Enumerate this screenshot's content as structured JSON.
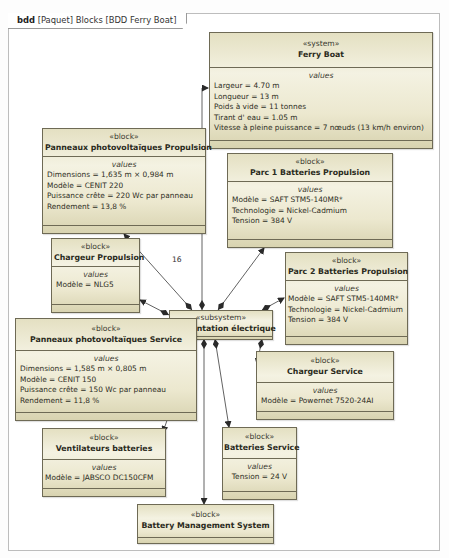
{
  "frame": {
    "kind": "bdd",
    "label": "[Paquet] Blocks [BDD Ferry Boat]"
  },
  "blocks": {
    "ferry_boat": {
      "stereotype": "«system»",
      "name": "Ferry Boat",
      "compartment": "values",
      "values": [
        "Largeur = 4.70 m",
        "Longueur = 13 m",
        "Poids à vide = 11 tonnes",
        "Tirant d' eau = 1.05 m",
        "Vitesse à pleine puissance = 7 nœuds (13 km/h environ)"
      ]
    },
    "panneaux_propulsion": {
      "stereotype": "«block»",
      "name": "Panneaux photovoltaïques Propulsion",
      "compartment": "values",
      "values": [
        "Dimensions = 1,635 m × 0,984 m",
        "Modèle = CENIT 220",
        "Puissance crête = 220 Wc par panneau",
        "Rendement = 13,8 %"
      ]
    },
    "parc1": {
      "stereotype": "«block»",
      "name": "Parc 1 Batteries Propulsion",
      "compartment": "values",
      "values": [
        "Modèle = SAFT STM5-140MR*",
        "Technologie = Nickel-Cadmium",
        "Tension = 384 V"
      ]
    },
    "chargeur_propulsion": {
      "stereotype": "«block»",
      "name": "Chargeur Propulsion",
      "compartment": "values",
      "values": [
        "Modèle = NLG5"
      ]
    },
    "parc2": {
      "stereotype": "«block»",
      "name": "Parc 2 Batteries Propulsion",
      "compartment": "values",
      "values": [
        "Modèle = SAFT STM5-140MR*",
        "Technologie = Nickel-Cadmium",
        "Tension = 384 V"
      ]
    },
    "alimentation": {
      "stereotype": "«subsystem»",
      "name": "Alimentation électrique"
    },
    "panneaux_service": {
      "stereotype": "«block»",
      "name": "Panneaux photovoltaïques Service",
      "compartment": "values",
      "values": [
        "Dimensions = 1,585 m × 0,805 m",
        "Modèle = CENIT 150",
        "Puissance crête = 150 Wc par panneau",
        "Rendement = 11,8 %"
      ]
    },
    "chargeur_service": {
      "stereotype": "«block»",
      "name": "Chargeur Service",
      "compartment": "values",
      "values": [
        "Modèle = Powernet 7520-24AI"
      ]
    },
    "ventilateurs": {
      "stereotype": "«block»",
      "name": "Ventilateurs batteries",
      "compartment": "values",
      "values": [
        "Modèle = JABSCO DC150CFM"
      ]
    },
    "batteries_service": {
      "stereotype": "«block»",
      "name": "Batteries Service",
      "compartment": "values",
      "values": [
        "Tension = 24 V"
      ]
    },
    "bms": {
      "stereotype": "«block»",
      "name": "Battery Management System"
    }
  },
  "multiplicities": {
    "panneaux_propulsion": "16",
    "panneaux_service": "8"
  },
  "colors": {
    "block_fill_light": "#f4f2e2",
    "block_fill_dark": "#d8d3b0",
    "block_border": "#6e6a55",
    "edge": "#333333"
  }
}
